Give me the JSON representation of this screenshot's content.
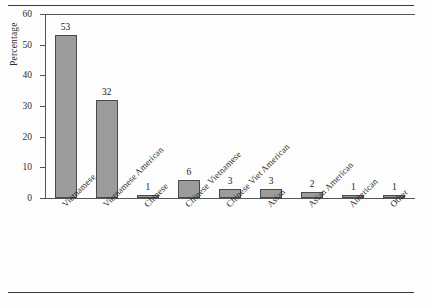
{
  "chart_data": {
    "type": "bar",
    "title": "",
    "xlabel": "",
    "ylabel": "Percentage",
    "ylim": [
      0,
      60
    ],
    "yticks": [
      0,
      10,
      20,
      30,
      40,
      50,
      60
    ],
    "grid": false,
    "legend": "none",
    "bar_color": "#9c9c9c",
    "categories": [
      "Vietnamese",
      "Vietnamese American",
      "Chinese",
      "Chinese Vietnamese",
      "Chinese Viet American",
      "Asian",
      "Asian American",
      "American",
      "Other"
    ],
    "values": [
      53,
      32,
      1,
      6,
      3,
      3,
      2,
      1,
      1
    ],
    "data_labels": [
      "53",
      "32",
      "1",
      "6",
      "3",
      "3",
      "2",
      "1",
      "1"
    ]
  },
  "axis": {
    "y_title": "Percentage",
    "y_tick_labels": [
      "0",
      "10",
      "20",
      "30",
      "40",
      "50",
      "60"
    ]
  }
}
